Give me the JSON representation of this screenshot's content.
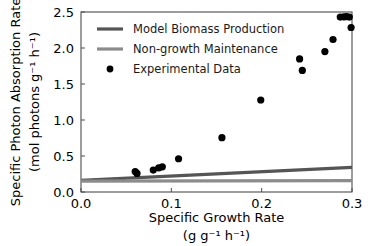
{
  "chart_data": {
    "type": "scatter",
    "title": "",
    "xlabel": "Specific Growth Rate",
    "xlabel_units": "(g g⁻¹ h⁻¹)",
    "ylabel": "Specific Photon Absorption Rate",
    "ylabel_units": "(mol photons g⁻¹ h⁻¹)",
    "xlim": [
      0.0,
      0.3
    ],
    "ylim": [
      0.0,
      2.5
    ],
    "xticks": [
      0.0,
      0.1,
      0.2,
      0.3
    ],
    "xtick_labels": [
      "0.0",
      "0.1",
      "0.2",
      "0.3"
    ],
    "yticks": [
      0.0,
      0.5,
      1.0,
      1.5,
      2.0,
      2.5
    ],
    "ytick_labels": [
      "0.0",
      "0.5",
      "1.0",
      "1.5",
      "2.0",
      "2.5"
    ],
    "grid": false,
    "legend_position": "upper left",
    "legend": [
      {
        "label": "Model Biomass Production",
        "marker": "line",
        "color": "#555555"
      },
      {
        "label": "Non-growth Maintenance",
        "marker": "line",
        "color": "#8c8c8c"
      },
      {
        "label": "Experimental Data",
        "marker": "circle",
        "color": "#000000"
      }
    ],
    "series": [
      {
        "name": "Model Biomass Production",
        "type": "line",
        "color": "#555555",
        "x": [
          0.0,
          0.3
        ],
        "values": [
          0.162,
          0.342
        ]
      },
      {
        "name": "Non-growth Maintenance",
        "type": "line",
        "color": "#8c8c8c",
        "x": [
          0.0,
          0.3
        ],
        "values": [
          0.15,
          0.158
        ]
      },
      {
        "name": "Experimental Data",
        "type": "scatter",
        "color": "#000000",
        "points": [
          {
            "x": 0.06,
            "y": 0.285
          },
          {
            "x": 0.062,
            "y": 0.258
          },
          {
            "x": 0.08,
            "y": 0.305
          },
          {
            "x": 0.086,
            "y": 0.335
          },
          {
            "x": 0.09,
            "y": 0.35
          },
          {
            "x": 0.108,
            "y": 0.462
          },
          {
            "x": 0.156,
            "y": 0.755
          },
          {
            "x": 0.199,
            "y": 1.278
          },
          {
            "x": 0.242,
            "y": 1.848
          },
          {
            "x": 0.245,
            "y": 1.688
          },
          {
            "x": 0.27,
            "y": 1.95
          },
          {
            "x": 0.279,
            "y": 2.118
          },
          {
            "x": 0.287,
            "y": 2.43
          },
          {
            "x": 0.291,
            "y": 2.432
          },
          {
            "x": 0.294,
            "y": 2.436
          },
          {
            "x": 0.297,
            "y": 2.43
          },
          {
            "x": 0.299,
            "y": 2.285
          }
        ]
      }
    ]
  }
}
